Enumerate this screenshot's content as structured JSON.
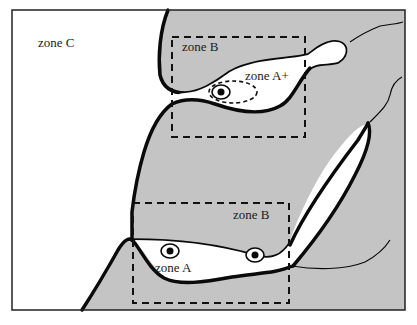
{
  "colors": {
    "background": "#ffffff",
    "tissue_fill": "#c4c4c4",
    "outline": "#0a0a0a",
    "frame": "#222222"
  },
  "labels": {
    "zone_c": "zone C",
    "zone_b_top": "zone B",
    "zone_a_plus": "zone A+",
    "zone_b_bottom": "zone B",
    "zone_a": "zone A"
  },
  "icons": [
    {
      "name": "cell-nucleus-icon",
      "zone": "zone A+"
    },
    {
      "name": "cell-nucleus-icon",
      "zone": "zone A (left)"
    },
    {
      "name": "cell-nucleus-icon",
      "zone": "zone A (right)"
    }
  ]
}
